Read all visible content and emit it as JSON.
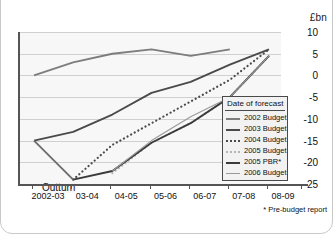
{
  "units_label": "£bn",
  "footnote": "* Pre-budget report",
  "annotation": {
    "outturn": "Outturn"
  },
  "legend": {
    "title": "Date of forecast",
    "items": [
      {
        "label": "2002 Budget",
        "color": "#7d7d7d",
        "style": "solid",
        "width": 2
      },
      {
        "label": "2003 Budget",
        "color": "#4a4a4a",
        "style": "solid",
        "width": 2
      },
      {
        "label": "2004 Budget",
        "color": "#4a4a4a",
        "style": "dotted",
        "width": 2
      },
      {
        "label": "2005 Budget",
        "color": "#b5b5b5",
        "style": "dotted",
        "width": 2
      },
      {
        "label": "2005 PBR*",
        "color": "#3a3a3a",
        "style": "solid",
        "width": 2
      },
      {
        "label": "2006 Budget",
        "color": "#9a9a9a",
        "style": "solid",
        "width": 1
      }
    ]
  },
  "chart_data": {
    "type": "line",
    "title": "",
    "xlabel": "",
    "ylabel": "£bn",
    "categories": [
      "2002-03",
      "03-04",
      "04-05",
      "05-06",
      "06-07",
      "07-08",
      "08-09"
    ],
    "ylim": [
      -25,
      10
    ],
    "yticks": [
      10,
      5,
      0,
      -5,
      -10,
      -15,
      -20,
      -25
    ],
    "grid": true,
    "legend_position": "inside-bottom-right",
    "series": [
      {
        "name": "2002 Budget",
        "color": "#7d7d7d",
        "style": "solid",
        "x": [
          "2002-03",
          "03-04",
          "04-05",
          "05-06",
          "06-07",
          "07-08"
        ],
        "values": [
          0,
          3,
          5,
          6,
          4.5,
          6
        ]
      },
      {
        "name": "2003 Budget",
        "color": "#4a4a4a",
        "style": "solid",
        "x": [
          "2002-03",
          "03-04",
          "04-05",
          "05-06",
          "06-07",
          "07-08",
          "08-09"
        ],
        "values": [
          -15,
          -13,
          -9,
          -4,
          -1.5,
          2.5,
          6
        ]
      },
      {
        "name": "2004 Budget",
        "color": "#4a4a4a",
        "style": "dotted",
        "x": [
          "03-04",
          "04-05",
          "05-06",
          "06-07",
          "07-08",
          "08-09"
        ],
        "values": [
          -24,
          -16,
          -11,
          -6,
          -1,
          6
        ]
      },
      {
        "name": "2005 Budget",
        "color": "#b5b5b5",
        "style": "dotted",
        "x": [
          "04-05",
          "05-06",
          "06-07",
          "07-08",
          "08-09"
        ],
        "values": [
          -22.5,
          -15.5,
          -11,
          -5,
          4.5
        ]
      },
      {
        "name": "2005 PBR*",
        "color": "#3a3a3a",
        "style": "solid",
        "x": [
          "03-04",
          "04-05",
          "05-06",
          "06-07",
          "07-08",
          "08-09"
        ],
        "values": [
          -24,
          -22,
          -15.5,
          -11,
          -5,
          4.5
        ]
      },
      {
        "name": "2006 Budget",
        "color": "#9a9a9a",
        "style": "solid",
        "x": [
          "04-05",
          "05-06",
          "06-07",
          "07-08",
          "08-09"
        ],
        "values": [
          -22,
          -15,
          -9.5,
          -5,
          4.5
        ]
      },
      {
        "name": "Outturn",
        "color": "#6e6e6e",
        "style": "solid",
        "x": [
          "2002-03",
          "03-04"
        ],
        "values": [
          -15,
          -24
        ]
      }
    ]
  }
}
